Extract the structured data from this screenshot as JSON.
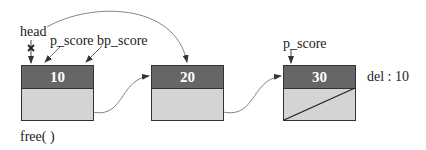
{
  "labels": {
    "head": "head",
    "p_score_1": "p_score",
    "bp_score": "bp_score",
    "p_score_3": "p_score",
    "free": "free( )",
    "del": "del : 10"
  },
  "nodes": [
    {
      "value": "10"
    },
    {
      "value": "20"
    },
    {
      "value": "30",
      "null_next": true
    }
  ],
  "colors": {
    "header": "#666666",
    "body": "#d4d4d4",
    "border": "#333333"
  }
}
